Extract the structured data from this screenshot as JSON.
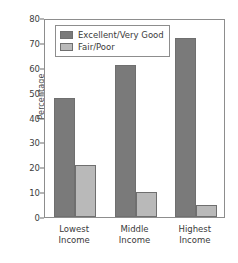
{
  "chart_data": {
    "type": "bar",
    "title": "",
    "subtitle": "",
    "xlabel": "",
    "ylabel": "Percentage",
    "categories": [
      "Lowest\nIncome",
      "Middle\nIncome",
      "Highest\nIncome"
    ],
    "category_lines": [
      [
        "Lowest",
        "Income"
      ],
      [
        "Middle",
        "Income"
      ],
      [
        "Highest",
        "Income"
      ]
    ],
    "series": [
      {
        "name": "Excellent/Very Good",
        "color": "#7a7a7a",
        "values": [
          48,
          61,
          72
        ]
      },
      {
        "name": "Fair/Poor",
        "color": "#b9b9b9",
        "values": [
          21,
          10,
          5
        ]
      }
    ],
    "ylim": [
      0,
      80
    ],
    "ytick_step": 10,
    "yticks": [
      0,
      10,
      20,
      30,
      40,
      50,
      60,
      70,
      80
    ],
    "ytick_labels": [
      "0",
      "10",
      "20",
      "30",
      "40",
      "50",
      "60",
      "70",
      "80"
    ],
    "grid": false,
    "legend_position": "upper-left-inside",
    "frame": true
  }
}
